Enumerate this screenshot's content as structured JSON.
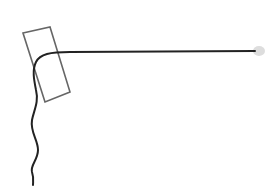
{
  "drawing": {
    "background": "#ffffff",
    "rectangle": {
      "points": "23,33 50,27 70,92 45,102",
      "stroke": "#666666",
      "stroke_width": "1.6"
    },
    "line": {
      "path": "M255,51 L70,52 C50,52 40,54 36,62 C32,70 34,80 36,90 C39,102 34,110 32,120 C30,132 38,140 38,150 C38,160 30,165 32,172 C34,178 33,182 33,185",
      "stroke": "#222222",
      "stroke_width": "2"
    },
    "tip": {
      "cx": "259",
      "cy": "51",
      "rx": "6",
      "ry": "5",
      "fill": "#dddddd"
    }
  }
}
